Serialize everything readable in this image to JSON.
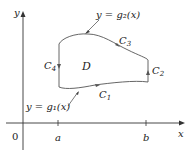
{
  "diagram": {
    "axes": {
      "x_label": "x",
      "y_label": "y",
      "origin_label": "0",
      "ticks": [
        "a",
        "b"
      ]
    },
    "region_label": "D",
    "curves": {
      "upper": "y = g₂(x)",
      "lower": "y = g₁(x)"
    },
    "boundary_labels": {
      "c1": "C",
      "c1_sub": "1",
      "c2": "C",
      "c2_sub": "2",
      "c3": "C",
      "c3_sub": "3",
      "c4": "C",
      "c4_sub": "4"
    },
    "colors": {
      "axis": "#333333",
      "curve": "#555555",
      "text": "#222222"
    }
  }
}
